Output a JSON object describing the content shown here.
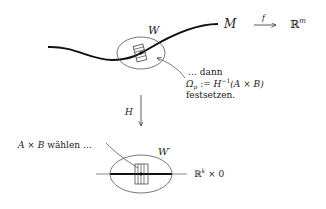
{
  "diagram": {
    "top": {
      "manifold_label": "M",
      "map_label": "f",
      "codomain_label": "ℝ",
      "codomain_exp": "m",
      "neighborhood_label": "W",
      "annotation": {
        "line1": "… dann",
        "line2_lhs": "Ω",
        "line2_sub": "p",
        "line2_assign": " := ",
        "line2_H": "H",
        "line2_exp": "−1",
        "line2_rhs": "(A × B)",
        "line3": "festsetzen."
      }
    },
    "map": {
      "label": "H"
    },
    "bottom": {
      "annotation": {
        "A": "A",
        "times": " × ",
        "B": "B",
        "text": " wählen …"
      },
      "neighborhood_label": "W′",
      "subspace_label_R": "ℝ",
      "subspace_exp": "k",
      "subspace_rest": " × 0"
    },
    "colors": {
      "stroke": "#222222",
      "thin": "#555555",
      "background": "#ffffff"
    }
  }
}
